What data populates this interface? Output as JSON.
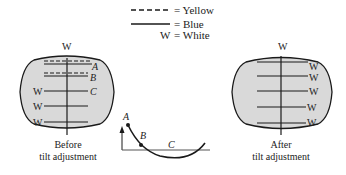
{
  "legend": {
    "yellow_label": "= Yellow",
    "blue_label": "= Blue",
    "white_symbol": "W",
    "white_label": "= White"
  },
  "before_screen": {
    "top_label": "W",
    "line_labels_right": [
      "A",
      "B",
      "C"
    ],
    "line_labels_left": [
      "W",
      "W",
      "W"
    ],
    "caption_line1": "Before",
    "caption_line2": "tilt adjustment"
  },
  "curve": {
    "labels": [
      "A",
      "B",
      "C"
    ]
  },
  "after_screen": {
    "top_label": "W",
    "line_labels_right": [
      "W",
      "W",
      "W",
      "W",
      "W"
    ],
    "caption_line1": "After",
    "caption_line2": "tilt adjustment"
  },
  "colors": {
    "screen_fill": "#d9d9d9",
    "line": "#1a1a1a"
  }
}
